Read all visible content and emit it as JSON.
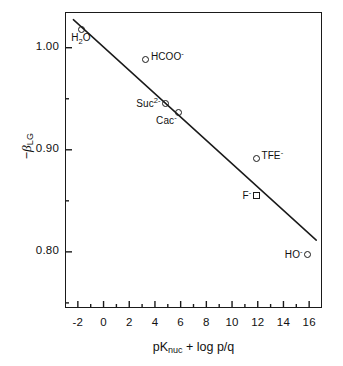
{
  "chart_data": {
    "type": "scatter",
    "title": "",
    "xlabel": "pKnuc + log p/q",
    "ylabel": "-BLG",
    "xlim": [
      -3,
      17
    ],
    "ylim": [
      0.745,
      1.035
    ],
    "grid": false,
    "legend": "none",
    "xticks": [
      "-2",
      "0",
      "2",
      "4",
      "6",
      "8",
      "10",
      "12",
      "14",
      "16"
    ],
    "xtick_values": [
      -2,
      0,
      2,
      4,
      6,
      8,
      10,
      12,
      14,
      16
    ],
    "xminor_ticks": [
      -1,
      1,
      3,
      5,
      7,
      9,
      11,
      13,
      15
    ],
    "yticks": [
      "1.00",
      "0.90",
      "0.80"
    ],
    "ytick_values": [
      1.0,
      0.9,
      0.8
    ],
    "yminor_ticks": [
      0.95,
      0.85,
      0.75
    ],
    "series": [
      {
        "name": "nucleophiles",
        "marker": "open-circle",
        "points": [
          {
            "label": "H2O",
            "label_html": "H<sub>2</sub>O",
            "x": -1.74,
            "y": 1.018,
            "label_pos": "below"
          },
          {
            "label": "HCOO-",
            "label_html": "HCOO<sup>-</sup>",
            "x": 3.3,
            "y": 0.988,
            "label_pos": "right"
          },
          {
            "label": "Suc2-",
            "label_html": "Suc<sup>2-</sup>",
            "x": 4.8,
            "y": 0.945,
            "label_pos": "left"
          },
          {
            "label": "Cac-",
            "label_html": "Cac<sup>-</sup>",
            "x": 5.8,
            "y": 0.937,
            "label_pos": "below-left"
          },
          {
            "label": "TFE-",
            "label_html": "TFE<sup>-</sup>",
            "x": 11.9,
            "y": 0.891,
            "label_pos": "right"
          },
          {
            "label": "HO-",
            "label_html": "HO<sup>-</sup>",
            "x": 15.9,
            "y": 0.797,
            "label_pos": "left"
          }
        ]
      },
      {
        "name": "fluoride",
        "marker": "open-square",
        "points": [
          {
            "label": "F-",
            "label_html": "F<sup>-</sup>",
            "x": 11.9,
            "y": 0.855,
            "label_pos": "left"
          }
        ]
      }
    ],
    "fit_line": {
      "type": "linear-regression",
      "x_start": -2.35,
      "y_start": 1.0275,
      "x_end": 16.55,
      "y_end": 0.8115
    }
  },
  "axes": {
    "y_title_prefix": "-",
    "y_title_symbol": "B",
    "y_title_sub": "LG",
    "x_title_main": "pK",
    "x_title_sub": "nuc",
    "x_title_rest": " + log p/q"
  }
}
